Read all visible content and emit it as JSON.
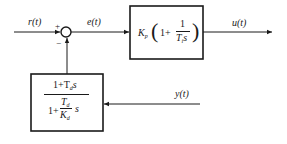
{
  "diagram": {
    "type": "control-loop-block-diagram",
    "signals": {
      "input": "r(t)",
      "error": "e(t)",
      "output": "u(t)",
      "feedback": "y(t)"
    },
    "summing_junction": {
      "plus_sign": "+",
      "minus_sign": "−"
    },
    "forward_block": {
      "gain": "K",
      "gain_sub": "p",
      "paren_open": "(",
      "paren_close": ")",
      "one_plus": "1+",
      "frac_num": "1",
      "frac_den_T": "T",
      "frac_den_sub": "i",
      "frac_den_s": "s"
    },
    "feedback_block": {
      "num_text": "1+T",
      "num_sub": "d",
      "num_s": "s",
      "den_one_plus": "1+",
      "den_frac_num_T": "T",
      "den_frac_num_sub": "d",
      "den_frac_den_K": "K",
      "den_frac_den_sub": "d",
      "den_s": "s"
    },
    "colors": {
      "line": "#1a1a1a",
      "background": "#ffffff"
    }
  }
}
